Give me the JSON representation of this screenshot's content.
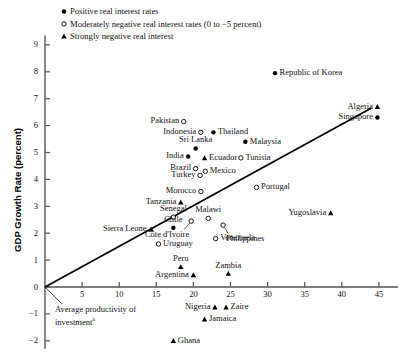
{
  "chart_data": {
    "type": "scatter",
    "title": "",
    "xlabel": "",
    "ylabel": "GDP Growth Rate (percent)",
    "xlim": [
      0,
      48
    ],
    "ylim": [
      -2.4,
      9.4
    ],
    "xticks": [
      5,
      10,
      15,
      20,
      25,
      30,
      35,
      40,
      45
    ],
    "yticks": [
      9,
      8,
      7,
      6,
      5,
      4,
      3,
      2,
      1,
      0,
      -1,
      -2
    ],
    "ytick_labels": [
      "9",
      "8",
      "7",
      "6",
      "5",
      "4",
      "3",
      "2",
      "1",
      "0",
      "−1",
      "−2"
    ],
    "grid": false,
    "legend_position": "top-left",
    "series": [
      {
        "name": "Positive real interest rates",
        "marker": "filled-circle"
      },
      {
        "name": "Moderately negative real interest rates (0 to −5 percent)",
        "marker": "open-circle"
      },
      {
        "name": "Strongly negative real interest",
        "marker": "filled-triangle"
      }
    ],
    "trendline": {
      "label": "Average productivity of investment",
      "footnote": "a",
      "x0": 0,
      "y0": 0,
      "x1": 44,
      "y1": 6.65
    },
    "points": [
      {
        "name": "Republic of Korea",
        "x": 31.0,
        "y": 7.95,
        "marker": "filled-circle",
        "label_side": "right"
      },
      {
        "name": "Algeria",
        "x": 44.8,
        "y": 6.7,
        "marker": "filled-triangle",
        "label_side": "left"
      },
      {
        "name": "Singapore",
        "x": 44.8,
        "y": 6.3,
        "marker": "filled-circle",
        "label_side": "left"
      },
      {
        "name": "Pakistan",
        "x": 18.7,
        "y": 6.15,
        "marker": "open-circle",
        "label_side": "left"
      },
      {
        "name": "Indonesia",
        "x": 21.0,
        "y": 5.75,
        "marker": "open-circle",
        "label_side": "left"
      },
      {
        "name": "Thailand",
        "x": 22.7,
        "y": 5.75,
        "marker": "filled-circle",
        "label_side": "right"
      },
      {
        "name": "Malaysia",
        "x": 27.0,
        "y": 5.4,
        "marker": "filled-circle",
        "label_side": "right"
      },
      {
        "name": "Sri Lanka",
        "x": 20.3,
        "y": 5.15,
        "marker": "filled-circle",
        "label_side": "above"
      },
      {
        "name": "India",
        "x": 19.3,
        "y": 4.85,
        "marker": "filled-circle",
        "label_side": "left"
      },
      {
        "name": "Ecuador",
        "x": 21.5,
        "y": 4.8,
        "marker": "filled-triangle",
        "label_side": "right"
      },
      {
        "name": "Tunisia",
        "x": 26.4,
        "y": 4.8,
        "marker": "open-circle",
        "label_side": "right"
      },
      {
        "name": "Brazil",
        "x": 20.3,
        "y": 4.4,
        "marker": "open-circle",
        "label_side": "left"
      },
      {
        "name": "Mexico",
        "x": 21.6,
        "y": 4.3,
        "marker": "open-circle",
        "label_side": "right"
      },
      {
        "name": "Turkey",
        "x": 20.9,
        "y": 4.15,
        "marker": "open-circle",
        "label_side": "left"
      },
      {
        "name": "Portugal",
        "x": 28.5,
        "y": 3.7,
        "marker": "open-circle",
        "label_side": "right"
      },
      {
        "name": "Morocco",
        "x": 21.0,
        "y": 3.55,
        "marker": "open-circle",
        "label_side": "left"
      },
      {
        "name": "Tanzania",
        "x": 18.3,
        "y": 3.15,
        "marker": "filled-triangle",
        "label_side": "left"
      },
      {
        "name": "Yugoslavia",
        "x": 38.5,
        "y": 2.75,
        "marker": "filled-triangle",
        "label_side": "left"
      },
      {
        "name": "Senegal",
        "x": 17.3,
        "y": 2.6,
        "marker": "open-circle",
        "label_side": "above"
      },
      {
        "name": "Malawi",
        "x": 22.0,
        "y": 2.55,
        "marker": "open-circle",
        "label_side": "above"
      },
      {
        "name": "Côte d'Ivoire",
        "x": 19.7,
        "y": 2.45,
        "marker": "open-circle",
        "label_side": "leader-down-left"
      },
      {
        "name": "Philippines",
        "x": 24.0,
        "y": 2.3,
        "marker": "open-circle",
        "label_side": "leader-down-right"
      },
      {
        "name": "Chile",
        "x": 17.3,
        "y": 2.2,
        "marker": "filled-circle",
        "label_side": "above"
      },
      {
        "name": "Sierra Leone",
        "x": 14.3,
        "y": 2.15,
        "marker": "filled-triangle",
        "label_side": "left"
      },
      {
        "name": "Venezuela",
        "x": 23.0,
        "y": 1.8,
        "marker": "open-circle",
        "label_side": "right"
      },
      {
        "name": "Uruguay",
        "x": 15.3,
        "y": 1.6,
        "marker": "open-circle",
        "label_side": "right"
      },
      {
        "name": "Peru",
        "x": 18.3,
        "y": 0.75,
        "marker": "filled-triangle",
        "label_side": "above"
      },
      {
        "name": "Argentina",
        "x": 20.0,
        "y": 0.45,
        "marker": "filled-triangle",
        "label_side": "left"
      },
      {
        "name": "Zambia",
        "x": 24.7,
        "y": 0.5,
        "marker": "filled-triangle",
        "label_side": "above"
      },
      {
        "name": "Nigeria",
        "x": 22.9,
        "y": -0.75,
        "marker": "filled-triangle",
        "label_side": "left"
      },
      {
        "name": "Zaire",
        "x": 24.4,
        "y": -0.75,
        "marker": "filled-triangle",
        "label_side": "right"
      },
      {
        "name": "Jamaica",
        "x": 21.5,
        "y": -1.2,
        "marker": "filled-triangle",
        "label_side": "right"
      },
      {
        "name": "Ghana",
        "x": 17.3,
        "y": -2.0,
        "marker": "filled-triangle",
        "label_side": "right"
      }
    ]
  }
}
